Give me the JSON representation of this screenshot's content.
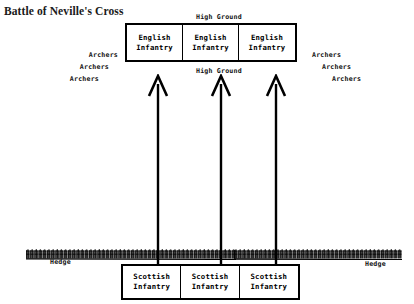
{
  "title": "Battle of Neville's Cross",
  "terrain": {
    "high_ground_top": "High Ground",
    "high_ground_bottom": "High Ground",
    "hedge_label_left": "Hedge",
    "hedge_label_right": "Hedge"
  },
  "english_units": [
    {
      "line1": "English",
      "line2": "Infantry"
    },
    {
      "line1": "English",
      "line2": "Infantry"
    },
    {
      "line1": "English",
      "line2": "Infantry"
    }
  ],
  "scottish_units": [
    {
      "line1": "Scottish",
      "line2": "Infantry"
    },
    {
      "line1": "Scottish",
      "line2": "Infantry"
    },
    {
      "line1": "Scottish",
      "line2": "Infantry"
    }
  ],
  "archers_left": [
    {
      "label": "Archers"
    },
    {
      "label": "Archers"
    },
    {
      "label": "Archers"
    }
  ],
  "archers_right": [
    {
      "label": "Archers"
    },
    {
      "label": "Archers"
    },
    {
      "label": "Archers"
    }
  ],
  "arrows": [
    {
      "name": "scottish-advance-arrow-1"
    },
    {
      "name": "scottish-advance-arrow-2"
    },
    {
      "name": "scottish-advance-arrow-3"
    }
  ],
  "colors": {
    "ink": "#000000",
    "paper": "#ffffff",
    "title_ink": "#1a1a1a"
  }
}
